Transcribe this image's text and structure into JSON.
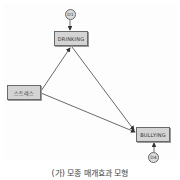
{
  "diagram": {
    "nodes": {
      "drinking": {
        "label": "DRINKING"
      },
      "stress": {
        "label": "스트레스"
      },
      "bullying": {
        "label": "BULLYING"
      },
      "d1": {
        "label": "D1"
      },
      "d4": {
        "label": "D4"
      }
    },
    "edges": [
      {
        "from": "스트레스",
        "to": "DRINKING"
      },
      {
        "from": "DRINKING",
        "to": "BULLYING"
      },
      {
        "from": "스트레스",
        "to": "BULLYING"
      },
      {
        "from": "D1",
        "to": "DRINKING"
      },
      {
        "from": "D4",
        "to": "BULLYING"
      }
    ],
    "caption": "(가) 모종 매개효과 모형"
  },
  "colors": {
    "node_fill": "#d4d4d4",
    "node_border": "#6a6a6a",
    "edge": "#444444"
  }
}
